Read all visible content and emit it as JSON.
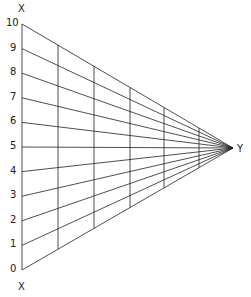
{
  "diagram": {
    "top_label": "X",
    "bottom_label": "X",
    "apex_label": "Y",
    "scale_labels": [
      "0",
      "1",
      "2",
      "3",
      "4",
      "5",
      "6",
      "7",
      "8",
      "9",
      "10"
    ],
    "line_color": "#222222",
    "apex": [
      233,
      148
    ],
    "left_line_x": 22,
    "y_top": 24,
    "y_bottom": 270,
    "vertical_lines_x": [
      58,
      94,
      130,
      164,
      199
    ]
  }
}
